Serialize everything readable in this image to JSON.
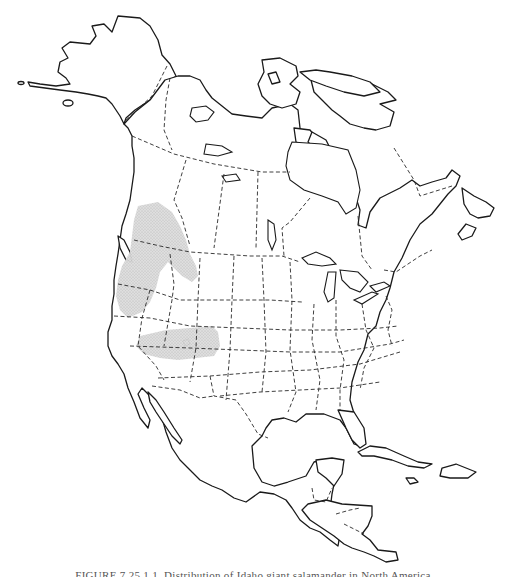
{
  "figure": {
    "type": "range map",
    "region": "North America",
    "caption": "FIGURE 7.25.1.1. Distribution of Idaho giant salamander in North America.",
    "caption_visible": "partially clipped at bottom edge"
  },
  "map": {
    "style": "black-and-white outline",
    "coastline_color": "#1a1a1a",
    "border_style": "dashed",
    "range_fill_color": "#d0d0d0",
    "range_areas": [
      {
        "name": "northern-range",
        "description": "Pacific Northwest: British Columbia south through Washington, northern Idaho, western Oregon"
      },
      {
        "name": "southern-range",
        "description": "Band across northern California, Nevada and Utah"
      }
    ]
  }
}
